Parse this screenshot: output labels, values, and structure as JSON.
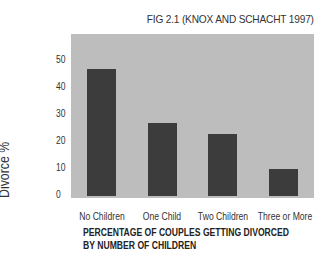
{
  "figure": {
    "caption": "FIG 2.1 (KNOX AND SCHACHT 1997)"
  },
  "colors": {
    "plot_background": "#bdbdbd",
    "bar": "#3c3c3c"
  },
  "chart_data": {
    "type": "bar",
    "title": "PERCENTAGE OF COUPLES GETTING DIVORCED BY NUMBER OF CHILDREN",
    "source": "FIG 2.1 (KNOX AND SCHACHT 1997)",
    "categories": [
      "No Children",
      "One Child",
      "Two Children",
      "Three or More"
    ],
    "values": [
      47,
      27,
      23,
      10
    ],
    "xlabel": "",
    "ylabel": "Divorce %",
    "ylim": [
      0,
      55
    ],
    "yticks": [
      0,
      10,
      20,
      30,
      40,
      50
    ],
    "grid": false,
    "legend": null
  },
  "axis": {
    "ylabel": "Divorce %",
    "yticks": [
      "0",
      "10",
      "20",
      "30",
      "40",
      "50"
    ],
    "xticks": [
      "No Children",
      "One Child",
      "Two Children",
      "Three or More"
    ],
    "title_line1": "PERCENTAGE OF COUPLES GETTING DIVORCED",
    "title_line2": "BY NUMBER OF CHILDREN"
  }
}
